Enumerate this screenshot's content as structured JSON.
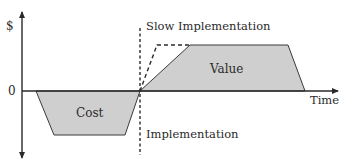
{
  "diagram": {
    "type": "cost-value-over-time",
    "axes": {
      "y_label": "$",
      "zero_label": "0",
      "x_label": "Time"
    },
    "regions": {
      "cost": {
        "label": "Cost",
        "fill": "#cfcfcf"
      },
      "value": {
        "label": "Value",
        "fill": "#cfcfcf"
      }
    },
    "annotations": {
      "slow_implementation": "Slow Implementation",
      "implementation": "Implementation"
    },
    "colors": {
      "axis": "#2a2a2a",
      "stroke": "#3a3a3a",
      "region_fill": "#cfcfcf",
      "background": "#ffffff"
    }
  }
}
